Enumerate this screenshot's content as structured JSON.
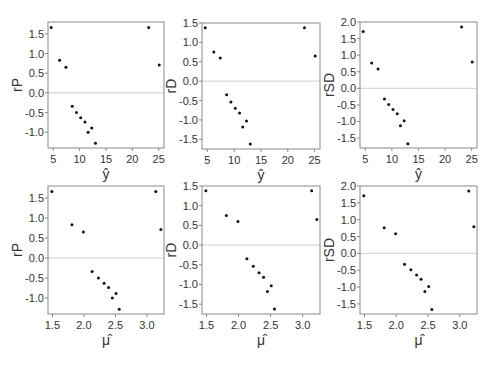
{
  "chart_data": [
    {
      "type": "scatter",
      "panel": "top-left",
      "title": "",
      "xlabel": "ŷ",
      "ylabel": "rP",
      "xlim": [
        4,
        26
      ],
      "ylim": [
        -1.4,
        1.8
      ],
      "xticks": [
        5,
        10,
        15,
        20,
        25
      ],
      "yticks": [
        -1.0,
        -0.5,
        0.0,
        0.5,
        1.0,
        1.5
      ],
      "ytick_labels": [
        "-1.0",
        "-0.5",
        "0.0",
        "0.5",
        "1.0",
        "1.5"
      ],
      "reference_line_y": 0,
      "grid": false,
      "x": [
        4.6,
        6.2,
        7.4,
        8.6,
        9.4,
        10.2,
        11.0,
        11.6,
        12.3,
        13.0,
        23.1,
        25.1
      ],
      "y": [
        1.66,
        0.83,
        0.65,
        -0.34,
        -0.5,
        -0.63,
        -0.74,
        -1.0,
        -0.89,
        -1.28,
        1.66,
        0.71
      ]
    },
    {
      "type": "scatter",
      "panel": "top-middle",
      "title": "",
      "xlabel": "ŷ",
      "ylabel": "rD",
      "xlim": [
        4,
        26
      ],
      "ylim": [
        -1.75,
        1.5
      ],
      "xticks": [
        5,
        10,
        15,
        20,
        25
      ],
      "yticks": [
        -1.5,
        -1.0,
        -0.5,
        0.0,
        0.5,
        1.0,
        1.5
      ],
      "ytick_labels": [
        "-1.5",
        "-1.0",
        "-0.5",
        "0.0",
        "0.5",
        "1.0",
        "1.5"
      ],
      "reference_line_y": 0,
      "grid": false,
      "x": [
        4.6,
        6.2,
        7.4,
        8.6,
        9.4,
        10.2,
        11.0,
        11.6,
        12.3,
        13.0,
        23.1,
        25.1
      ],
      "y": [
        1.38,
        0.75,
        0.6,
        -0.35,
        -0.54,
        -0.7,
        -0.82,
        -1.18,
        -1.03,
        -1.62,
        1.38,
        0.65
      ]
    },
    {
      "type": "scatter",
      "panel": "top-right",
      "title": "",
      "xlabel": "ŷ",
      "ylabel": "rSD",
      "xlim": [
        4,
        26
      ],
      "ylim": [
        -1.8,
        2.0
      ],
      "xticks": [
        5,
        10,
        15,
        20,
        25
      ],
      "yticks": [
        -1.5,
        -1.0,
        -0.5,
        0.0,
        0.5,
        1.0,
        1.5,
        2.0
      ],
      "ytick_labels": [
        "-1.5",
        "-1.0",
        "-0.5",
        "0.0",
        "0.5",
        "1.0",
        "1.5",
        "2.0"
      ],
      "reference_line_y": 0,
      "grid": false,
      "x": [
        4.6,
        6.2,
        7.4,
        8.6,
        9.4,
        10.2,
        11.0,
        11.6,
        12.3,
        13.0,
        23.1,
        25.1
      ],
      "y": [
        1.71,
        0.76,
        0.58,
        -0.32,
        -0.49,
        -0.64,
        -0.77,
        -1.13,
        -0.98,
        -1.67,
        1.85,
        0.79
      ]
    },
    {
      "type": "scatter",
      "panel": "bottom-left",
      "title": "",
      "xlabel": "μ̂",
      "ylabel": "rP",
      "xlim": [
        1.43,
        3.27
      ],
      "ylim": [
        -1.4,
        1.8
      ],
      "xticks": [
        1.5,
        2.0,
        2.5,
        3.0
      ],
      "xtick_labels": [
        "1.5",
        "2.0",
        "2.5",
        "3.0"
      ],
      "yticks": [
        -1.0,
        -0.5,
        0.0,
        0.5,
        1.0,
        1.5
      ],
      "ytick_labels": [
        "-1.0",
        "-0.5",
        "0.0",
        "0.5",
        "1.0",
        "1.5"
      ],
      "reference_line_y": 0,
      "grid": false,
      "x": [
        1.49,
        1.81,
        1.99,
        2.13,
        2.23,
        2.32,
        2.39,
        2.45,
        2.51,
        2.56,
        3.14,
        3.22
      ],
      "y": [
        1.66,
        0.83,
        0.65,
        -0.34,
        -0.5,
        -0.63,
        -0.74,
        -1.0,
        -0.89,
        -1.28,
        1.66,
        0.71
      ]
    },
    {
      "type": "scatter",
      "panel": "bottom-middle",
      "title": "",
      "xlabel": "μ̂",
      "ylabel": "rD",
      "xlim": [
        1.43,
        3.27
      ],
      "ylim": [
        -1.75,
        1.5
      ],
      "xticks": [
        1.5,
        2.0,
        2.5,
        3.0
      ],
      "xtick_labels": [
        "1.5",
        "2.0",
        "2.5",
        "3.0"
      ],
      "yticks": [
        -1.5,
        -1.0,
        -0.5,
        0.0,
        0.5,
        1.0,
        1.5
      ],
      "ytick_labels": [
        "-1.5",
        "-1.0",
        "-0.5",
        "0.0",
        "0.5",
        "1.0",
        "1.5"
      ],
      "reference_line_y": 0,
      "grid": false,
      "x": [
        1.49,
        1.81,
        1.99,
        2.13,
        2.23,
        2.32,
        2.39,
        2.45,
        2.51,
        2.56,
        3.14,
        3.22
      ],
      "y": [
        1.38,
        0.75,
        0.6,
        -0.35,
        -0.54,
        -0.7,
        -0.82,
        -1.18,
        -1.03,
        -1.62,
        1.38,
        0.65
      ]
    },
    {
      "type": "scatter",
      "panel": "bottom-right",
      "title": "",
      "xlabel": "μ̂",
      "ylabel": "rSD",
      "xlim": [
        1.43,
        3.27
      ],
      "ylim": [
        -1.8,
        2.0
      ],
      "xticks": [
        1.5,
        2.0,
        2.5,
        3.0
      ],
      "xtick_labels": [
        "1.5",
        "2.0",
        "2.5",
        "3.0"
      ],
      "yticks": [
        -1.5,
        -1.0,
        -0.5,
        0.0,
        0.5,
        1.0,
        1.5,
        2.0
      ],
      "ytick_labels": [
        "-1.5",
        "-1.0",
        "-0.5",
        "0.0",
        "0.5",
        "1.0",
        "1.5",
        "2.0"
      ],
      "reference_line_y": 0,
      "grid": false,
      "x": [
        1.49,
        1.81,
        1.99,
        2.13,
        2.23,
        2.32,
        2.39,
        2.45,
        2.51,
        2.56,
        3.14,
        3.22
      ],
      "y": [
        1.71,
        0.76,
        0.58,
        -0.32,
        -0.49,
        -0.64,
        -0.77,
        -1.13,
        -0.98,
        -1.67,
        1.85,
        0.79
      ]
    }
  ],
  "style": {
    "point_color": "#111111",
    "axis_color": "#8a8a8a",
    "zero_line_color": "#cfcfcf",
    "text_color": "#333333"
  }
}
